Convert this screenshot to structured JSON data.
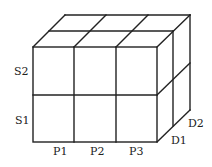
{
  "diagram": {
    "type": "3d-cube-grid",
    "row_labels": [
      "S2",
      "S1"
    ],
    "column_labels": [
      "P1",
      "P2",
      "P3"
    ],
    "depth_labels": [
      "D1",
      "D2"
    ],
    "stroke_color": "#222222"
  },
  "labels": {
    "s2": "S2",
    "s1": "S1",
    "p1": "P1",
    "p2": "P2",
    "p3": "P3",
    "d1": "D1",
    "d2": "D2"
  }
}
